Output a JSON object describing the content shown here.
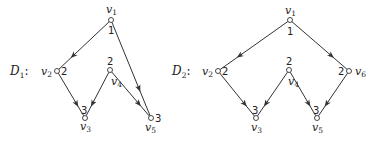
{
  "graphs": [
    {
      "name": "D",
      "index": "1",
      "label_suffix": ":",
      "label_pos": [
        10,
        75
      ],
      "nodes": [
        {
          "id": "v1",
          "base": "v",
          "sub": "1",
          "weight": "1",
          "x": 111,
          "y": 20,
          "lx": 106,
          "ly": 13,
          "wx": 108,
          "wy": 34
        },
        {
          "id": "v2",
          "base": "v",
          "sub": "2",
          "weight": "2",
          "x": 57,
          "y": 71,
          "lx": 41,
          "ly": 75,
          "wx": 61,
          "wy": 75
        },
        {
          "id": "v3",
          "base": "v",
          "sub": "3",
          "weight": "3",
          "x": 85,
          "y": 118,
          "lx": 80,
          "ly": 130,
          "wx": 81,
          "wy": 114
        },
        {
          "id": "v4",
          "base": "v",
          "sub": "4",
          "weight": "2",
          "x": 110,
          "y": 70,
          "lx": 111,
          "ly": 85,
          "wx": 107,
          "wy": 65
        },
        {
          "id": "v5",
          "base": "v",
          "sub": "5",
          "weight": "3",
          "x": 151,
          "y": 118,
          "lx": 145,
          "ly": 131,
          "wx": 155,
          "wy": 122
        }
      ],
      "edges": [
        {
          "from": "v1",
          "to": "v2"
        },
        {
          "from": "v1",
          "to": "v5"
        },
        {
          "from": "v2",
          "to": "v3"
        },
        {
          "from": "v4",
          "to": "v3"
        },
        {
          "from": "v4",
          "to": "v5"
        }
      ]
    },
    {
      "name": "D",
      "index": "2",
      "label_suffix": ":",
      "label_pos": [
        172,
        75
      ],
      "nodes": [
        {
          "id": "v1",
          "base": "v",
          "sub": "1",
          "weight": "1",
          "x": 290,
          "y": 20,
          "lx": 285,
          "ly": 14,
          "wx": 287,
          "wy": 35
        },
        {
          "id": "v2",
          "base": "v",
          "sub": "2",
          "weight": "2",
          "x": 218,
          "y": 71,
          "lx": 202,
          "ly": 75,
          "wx": 222,
          "wy": 75
        },
        {
          "id": "v3",
          "base": "v",
          "sub": "3",
          "weight": "3",
          "x": 256,
          "y": 118,
          "lx": 251,
          "ly": 131,
          "wx": 252,
          "wy": 114
        },
        {
          "id": "v4",
          "base": "v",
          "sub": "4",
          "weight": "2",
          "x": 289,
          "y": 70,
          "lx": 288,
          "ly": 85,
          "wx": 286,
          "wy": 65
        },
        {
          "id": "v5",
          "base": "v",
          "sub": "5",
          "weight": "3",
          "x": 317,
          "y": 118,
          "lx": 312,
          "ly": 131,
          "wx": 313,
          "wy": 114
        },
        {
          "id": "v6",
          "base": "v",
          "sub": "6",
          "weight": "2",
          "x": 349,
          "y": 71,
          "lx": 355,
          "ly": 75,
          "wx": 338,
          "wy": 75
        }
      ],
      "edges": [
        {
          "from": "v1",
          "to": "v2"
        },
        {
          "from": "v1",
          "to": "v6"
        },
        {
          "from": "v2",
          "to": "v3"
        },
        {
          "from": "v4",
          "to": "v3"
        },
        {
          "from": "v4",
          "to": "v5"
        },
        {
          "from": "v6",
          "to": "v5"
        }
      ]
    }
  ]
}
